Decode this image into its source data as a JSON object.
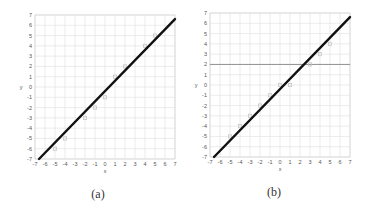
{
  "chart_data": [
    {
      "type": "line",
      "panel_label": "(a)",
      "xlabel": "x",
      "ylabel": "y",
      "xlim": [
        -7,
        7
      ],
      "ylim": [
        -7,
        7
      ],
      "x_ticks": [
        -7,
        -6,
        -5,
        -4,
        -3,
        -2,
        -1,
        0,
        1,
        2,
        3,
        4,
        5,
        6,
        7
      ],
      "y_ticks": [
        -7,
        -6,
        -5,
        -4,
        -3,
        -2,
        -1,
        0,
        1,
        2,
        3,
        4,
        5,
        6,
        7
      ],
      "grid": true,
      "series": [
        {
          "name": "fit line",
          "kind": "line",
          "color": "#111111",
          "x": [
            -6.6,
            7
          ],
          "y": [
            -7,
            6.6
          ]
        },
        {
          "name": "data points",
          "kind": "scatter",
          "color": "#c8c8c8",
          "x": [
            -5,
            -4,
            -2,
            -1,
            0,
            1,
            2,
            4,
            5
          ],
          "y": [
            -6,
            -5,
            -3,
            -2,
            -1,
            1,
            2,
            4,
            5
          ]
        }
      ],
      "reference_lines": []
    },
    {
      "type": "line",
      "panel_label": "(b)",
      "xlabel": "x",
      "ylabel": "y",
      "xlim": [
        -7,
        7
      ],
      "ylim": [
        -7,
        7
      ],
      "x_ticks": [
        -7,
        -6,
        -5,
        -4,
        -3,
        -2,
        -1,
        0,
        1,
        2,
        3,
        4,
        5,
        6,
        7
      ],
      "y_ticks": [
        -7,
        -6,
        -5,
        -4,
        -3,
        -2,
        -1,
        0,
        1,
        2,
        3,
        4,
        5,
        6,
        7
      ],
      "grid": true,
      "series": [
        {
          "name": "fit line",
          "kind": "line",
          "color": "#111111",
          "x": [
            -6.6,
            7
          ],
          "y": [
            -7,
            6.6
          ]
        },
        {
          "name": "data points",
          "kind": "scatter",
          "color": "#c8c8c8",
          "x": [
            -5,
            -4,
            -3,
            -2,
            -1,
            0,
            1,
            3,
            4,
            5
          ],
          "y": [
            -5,
            -4,
            -3,
            -2,
            -1,
            0,
            0,
            2,
            3,
            4
          ]
        }
      ],
      "reference_lines": [
        {
          "orientation": "horizontal",
          "y": 2,
          "color": "#888888"
        }
      ]
    }
  ],
  "panels": [
    {
      "caption": "(a)",
      "xlabel": "x",
      "ylabel": "y"
    },
    {
      "caption": "(b)",
      "xlabel": "x",
      "ylabel": "y"
    }
  ]
}
